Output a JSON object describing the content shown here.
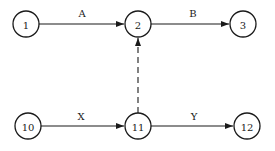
{
  "diagram": {
    "type": "activity-network",
    "nodes": [
      {
        "id": "n1",
        "label": "1",
        "x": 26,
        "y": 24
      },
      {
        "id": "n2",
        "label": "2",
        "x": 138,
        "y": 24
      },
      {
        "id": "n3",
        "label": "3",
        "x": 243,
        "y": 24
      },
      {
        "id": "n10",
        "label": "10",
        "x": 28,
        "y": 126
      },
      {
        "id": "n11",
        "label": "11",
        "x": 138,
        "y": 126
      },
      {
        "id": "n12",
        "label": "12",
        "x": 247,
        "y": 126
      }
    ],
    "edges": [
      {
        "from": "1",
        "to": "2",
        "label": "A",
        "style": "solid"
      },
      {
        "from": "2",
        "to": "3",
        "label": "B",
        "style": "solid"
      },
      {
        "from": "11",
        "to": "2",
        "label": "",
        "style": "dashed"
      },
      {
        "from": "10",
        "to": "11",
        "label": "X",
        "style": "solid"
      },
      {
        "from": "11",
        "to": "12",
        "label": "Y",
        "style": "solid"
      }
    ]
  }
}
